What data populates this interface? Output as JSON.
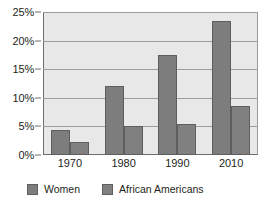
{
  "chart_data": {
    "type": "bar",
    "title": "",
    "xlabel": "",
    "ylabel": "",
    "categories": [
      "1970",
      "1980",
      "1990",
      "2010"
    ],
    "series": [
      {
        "name": "Women",
        "values": [
          4.3,
          12.1,
          17.5,
          23.5
        ],
        "color": "#7d7d7d"
      },
      {
        "name": "African Americans",
        "values": [
          2.3,
          5.0,
          5.4,
          8.6
        ],
        "color": "#808080"
      }
    ],
    "ylim": [
      0,
      25
    ],
    "ytick_values": [
      0,
      5,
      10,
      15,
      20,
      25
    ],
    "ytick_labels": [
      "0%",
      "5%",
      "10%",
      "15%",
      "20%",
      "25%"
    ],
    "grid": true,
    "legend_position": "bottom-left",
    "plot_background": "#e8e8e8",
    "page_background": "#ffffff"
  }
}
